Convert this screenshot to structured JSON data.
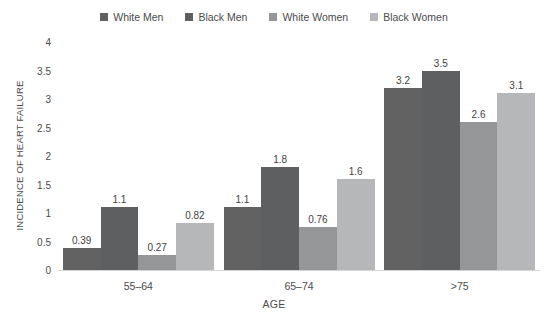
{
  "chart_data": {
    "type": "bar",
    "title": "",
    "subtitle": "",
    "xlabel": "AGE",
    "ylabel": "INCIDENCE OF HEART FAILURE",
    "categories": [
      "55–64",
      "65–74",
      ">75"
    ],
    "series": [
      {
        "name": "White Men",
        "color": "#626262",
        "values": [
          0.39,
          1.1,
          3.2
        ]
      },
      {
        "name": "Black Men",
        "color": "#5d5f61",
        "values": [
          1.1,
          1.8,
          3.5
        ]
      },
      {
        "name": "White Women",
        "color": "#949698",
        "values": [
          0.27,
          0.76,
          2.6
        ]
      },
      {
        "name": "Black Women",
        "color": "#b5b7b9",
        "values": [
          0.82,
          1.6,
          3.1
        ]
      }
    ],
    "value_labels": [
      [
        "0.39",
        "1.1",
        "0.27",
        "0.82"
      ],
      [
        "1.1",
        "1.8",
        "0.76",
        "1.6"
      ],
      [
        "3.2",
        "3.5",
        "2.6",
        "3.1"
      ]
    ],
    "ylim": [
      0,
      4
    ],
    "yticks": [
      0,
      0.5,
      1,
      1.5,
      2,
      2.5,
      3,
      3.5,
      4
    ],
    "ytick_labels": [
      "0",
      "0.5",
      "1",
      "1.5",
      "2",
      "2.5",
      "3",
      "3.5",
      "4"
    ],
    "grid": false,
    "legend_position": "top",
    "orientation": "vertical",
    "background": "#ffffff",
    "text_color": "#4b4b4b"
  }
}
